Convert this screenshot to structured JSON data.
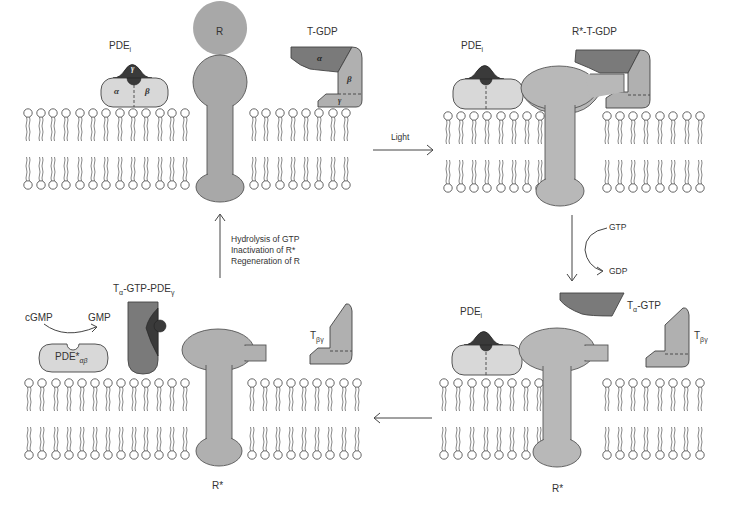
{
  "diagram": {
    "type": "phototransduction-cycle",
    "colors": {
      "membrane_stroke": "#555555",
      "receptor_fill": "#a8a8a8",
      "receptor_active_fill": "#b8b8b8",
      "t_alpha_fill": "#7a7a7a",
      "t_beta_fill": "#b0b0b0",
      "pde_fill": "#d8d8d8",
      "pde_gamma_fill": "#3a3a3a",
      "arrow": "#444444"
    },
    "panels": {
      "top_left": {
        "pde_label": "PDE",
        "pde_sub": "i",
        "pde_alpha": "α",
        "pde_beta": "β",
        "pde_gamma": "γ",
        "receptor_label": "R",
        "t_label": "T-GDP",
        "t_alpha": "α",
        "t_beta": "β",
        "t_gamma": "γ"
      },
      "top_right": {
        "pde_label": "PDE",
        "pde_sub": "i",
        "complex_label": "R*-T-GDP"
      },
      "bottom_right": {
        "pde_label": "PDE",
        "pde_sub": "i",
        "t_alpha_label": "T",
        "t_alpha_sub": "α",
        "t_alpha_suffix": "-GTP",
        "t_beta_gamma_label": "T",
        "t_beta_gamma_sub": "βγ",
        "receptor_label": "R*"
      },
      "bottom_left": {
        "substrate": "cGMP",
        "product": "GMP",
        "pde_active_label": "PDE*",
        "pde_active_sub": "αβ",
        "complex_label_t": "T",
        "complex_label_t_sub": "α",
        "complex_label_mid": "-GTP-PDE",
        "complex_label_sub": "γ",
        "t_beta_gamma_label": "T",
        "t_beta_gamma_sub": "βγ",
        "receptor_label": "R*"
      }
    },
    "arrows": {
      "light": "Light",
      "gtp_in": "GTP",
      "gdp_out": "GDP",
      "return_line1": "Hydrolysis of GTP",
      "return_line2": "Inactivation of R*",
      "return_line3": "Regeneration of R"
    }
  }
}
